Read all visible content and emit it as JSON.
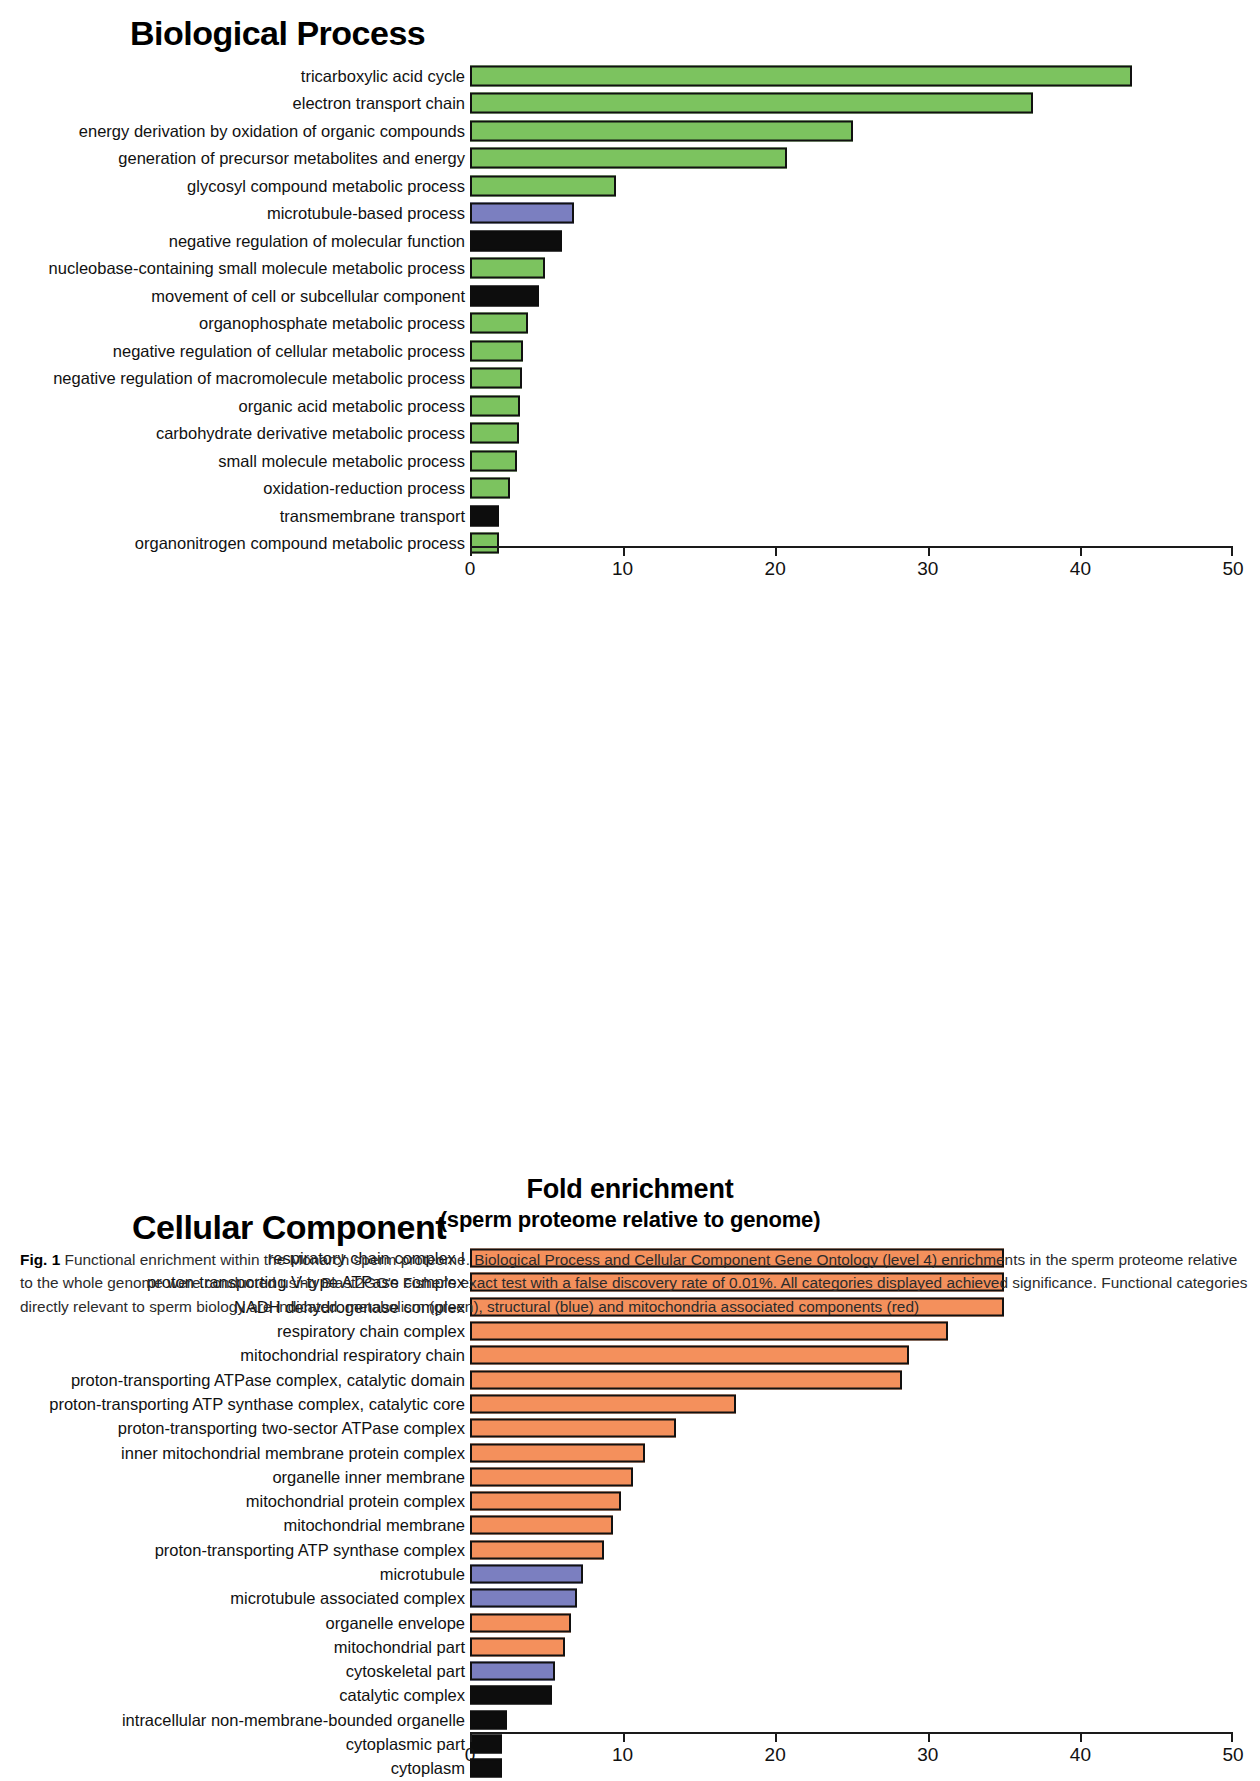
{
  "figure": {
    "axis_title_line1": "Fold enrichment",
    "axis_title_line2": "(sperm proteome relative to genome)",
    "caption_number": "Fig. 1",
    "caption_text": " Functional enrichment within the Monarch sperm proteome. Biological Process and Cellular Component Gene Ontology (level 4) enrichments in the sperm proteome relative to the whole genome were conducted using Blast2GO's Fisher's exact test with a false discovery rate of 0.01%. All categories displayed achieved significance. Functional categories directly relevant to sperm biology are indicated: metabolism (green), structural (blue) and mitochondria associated components (red)"
  },
  "colors": {
    "metabolism_green": "#7cc35f",
    "structural_blue": "#7b7fc0",
    "mitochondria_red": "#f4905c",
    "other_black": "#0d0d0d"
  },
  "chart_data": [
    {
      "type": "bar",
      "orientation": "horizontal",
      "title": "Biological Process",
      "xlabel": "Fold enrichment (sperm proteome relative to genome)",
      "ylabel": "",
      "xlim": [
        0,
        50
      ],
      "xticks": [
        0,
        10,
        20,
        30,
        40,
        50
      ],
      "xtick_labels": [
        "0",
        "10",
        "20",
        "30",
        "40",
        "50"
      ],
      "grid": false,
      "legend": false,
      "categories": [
        "tricarboxylic acid cycle",
        "electron transport chain",
        "energy derivation by oxidation of organic compounds",
        "generation of precursor metabolites and energy",
        "glycosyl compound metabolic process",
        "microtubule-based process",
        "negative regulation of molecular function",
        "nucleobase-containing small molecule metabolic process",
        "movement of cell or subcellular component",
        "organophosphate metabolic process",
        "negative regulation of cellular metabolic process",
        "negative regulation of macromolecule metabolic process",
        "organic acid metabolic process",
        "carbohydrate derivative metabolic process",
        "small molecule metabolic process",
        "oxidation-reduction process",
        "transmembrane transport",
        "organonitrogen compound metabolic process"
      ],
      "values": [
        43.4,
        36.9,
        25.1,
        20.8,
        9.6,
        6.8,
        6.0,
        4.9,
        4.5,
        3.8,
        3.5,
        3.4,
        3.3,
        3.2,
        3.1,
        2.6,
        1.9,
        1.9
      ],
      "bar_colors": [
        "metabolism_green",
        "metabolism_green",
        "metabolism_green",
        "metabolism_green",
        "metabolism_green",
        "structural_blue",
        "other_black",
        "metabolism_green",
        "other_black",
        "metabolism_green",
        "metabolism_green",
        "metabolism_green",
        "metabolism_green",
        "metabolism_green",
        "metabolism_green",
        "metabolism_green",
        "other_black",
        "metabolism_green"
      ]
    },
    {
      "type": "bar",
      "orientation": "horizontal",
      "title": "Cellular Component",
      "xlabel": "Fold enrichment (sperm proteome relative to genome)",
      "ylabel": "",
      "xlim": [
        0,
        50
      ],
      "xticks": [
        0,
        10,
        20,
        30,
        40,
        50
      ],
      "xtick_labels": [
        "0",
        "10",
        "20",
        "30",
        "40",
        "50"
      ],
      "grid": false,
      "legend": false,
      "categories": [
        "respiratory chain complex I",
        "proton-transporting V-type ATPase complex",
        "NADH dehydrogenase complex",
        "respiratory chain complex",
        "mitochondrial respiratory chain",
        "proton-transporting ATPase complex, catalytic domain",
        "proton-transporting ATP synthase complex, catalytic core",
        "proton-transporting two-sector ATPase complex",
        "inner mitochondrial membrane protein complex",
        "organelle inner membrane",
        "mitochondrial protein complex",
        "mitochondrial membrane",
        "proton-transporting ATP synthase complex",
        "microtubule",
        "microtubule associated complex",
        "organelle envelope",
        "mitochondrial part",
        "cytoskeletal part",
        "catalytic complex",
        "intracellular non-membrane-bounded organelle",
        "cytoplasmic part",
        "cytoplasm"
      ],
      "values": [
        35.0,
        35.0,
        35.0,
        31.3,
        28.8,
        28.3,
        17.4,
        13.5,
        11.5,
        10.7,
        9.9,
        9.4,
        8.8,
        7.4,
        7.0,
        6.6,
        6.2,
        5.6,
        5.4,
        2.4,
        2.1,
        2.1
      ],
      "bar_colors": [
        "mitochondria_red",
        "mitochondria_red",
        "mitochondria_red",
        "mitochondria_red",
        "mitochondria_red",
        "mitochondria_red",
        "mitochondria_red",
        "mitochondria_red",
        "mitochondria_red",
        "mitochondria_red",
        "mitochondria_red",
        "mitochondria_red",
        "mitochondria_red",
        "structural_blue",
        "structural_blue",
        "mitochondria_red",
        "mitochondria_red",
        "structural_blue",
        "other_black",
        "other_black",
        "other_black",
        "other_black"
      ]
    }
  ]
}
